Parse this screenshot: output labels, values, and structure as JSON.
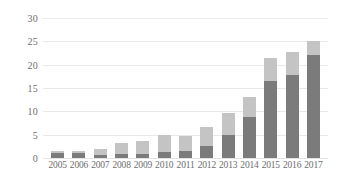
{
  "chart_data": {
    "type": "bar",
    "stacked": true,
    "title": "",
    "subtitle": "",
    "xlabel": "",
    "ylabel": "",
    "ylim": [
      0,
      30
    ],
    "ytick_step": 5,
    "yticks": [
      30,
      25,
      20,
      15,
      10,
      5,
      0
    ],
    "grid": true,
    "legend": "none",
    "categories": [
      "2005",
      "2006",
      "2007",
      "2008",
      "2009",
      "2010",
      "2011",
      "2012",
      "2013",
      "2014",
      "2015",
      "2016",
      "2017"
    ],
    "series": [
      {
        "name": "lower-segment",
        "color": "#7b7b7b",
        "values": [
          1.0,
          1.0,
          0.7,
          0.8,
          0.9,
          1.3,
          1.6,
          2.6,
          5.0,
          8.8,
          16.5,
          17.8,
          22.0
        ]
      },
      {
        "name": "upper-segment",
        "color": "#c4c4c4",
        "values": [
          0.6,
          0.4,
          1.2,
          2.4,
          2.7,
          3.7,
          3.1,
          4.1,
          4.7,
          4.2,
          4.9,
          4.9,
          3.1
        ]
      }
    ],
    "totals": [
      1.6,
      1.4,
      1.9,
      3.2,
      3.6,
      5.0,
      4.7,
      6.7,
      9.7,
      13.0,
      21.4,
      22.7,
      25.1
    ]
  },
  "style": {
    "background": "#ffffff",
    "gridline_color": "#e9e9e9",
    "tick_label_color": "#6d6d6d"
  }
}
